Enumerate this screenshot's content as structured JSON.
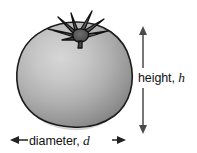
{
  "figure": {
    "background_color": "#ffffff",
    "subject": {
      "name": "tomato",
      "body_color_light": "#cfcfcf",
      "body_color_mid": "#a8a8a8",
      "body_color_dark": "#7e7e7e",
      "outline_color": "#1a1a1a",
      "stem_color": "#5a5a5a",
      "stem_outline_color": "#111111"
    },
    "annotations": {
      "height": {
        "icon": "double-headed-vertical-arrow",
        "text_prefix": "height, ",
        "variable": "h",
        "full_text": "height, h",
        "arrow_color": "#444444",
        "arrow_x": 143,
        "arrow_top_y": 27,
        "arrow_bottom_y": 133
      },
      "diameter": {
        "icon": "double-headed-horizontal-arrow",
        "text_prefix": "diameter, ",
        "variable": "d",
        "full_text": "diameter, d",
        "arrow_color": "#222222",
        "arrow_y": 140,
        "arrow_left_x": 11,
        "arrow_right_x": 125
      }
    }
  }
}
